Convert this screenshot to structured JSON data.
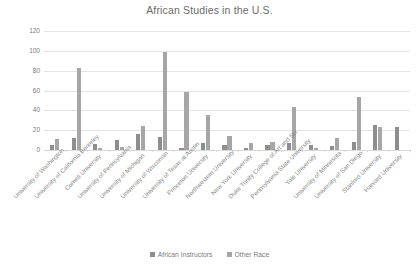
{
  "chart_data": {
    "type": "bar",
    "title": "African Studies in the U.S.",
    "xlabel": "",
    "ylabel": "",
    "ylim": [
      0,
      120
    ],
    "yticks": [
      0,
      20,
      40,
      60,
      80,
      100,
      120
    ],
    "grid": true,
    "legend_position": "bottom",
    "categories": [
      "University of Washington",
      "University of California Berkeley",
      "Cornell University",
      "University of Pennsylvania",
      "University of Michigan",
      "University of Wisconsin",
      "University of Texas at Austin",
      "Princeton University",
      "Northwestern University",
      "New York University",
      "Duke Trinity College of Art and Sci",
      "Pennsylvania State University",
      "Yale University",
      "University of Minnesota",
      "University of San Diego",
      "Stanford University",
      "Harvard University"
    ],
    "series": [
      {
        "name": "African Instructors",
        "color": "#8e8e8e",
        "values": [
          5,
          12,
          6,
          10,
          16,
          13,
          2,
          7,
          5,
          2,
          5,
          7,
          5,
          4,
          8,
          25,
          23
        ]
      },
      {
        "name": "Other Race",
        "color": "#a6a6a6",
        "values": [
          11,
          83,
          2,
          3,
          24,
          99,
          59,
          35,
          14,
          7,
          8,
          43,
          2,
          12,
          53,
          23,
          0
        ]
      }
    ]
  },
  "legend": {
    "entries": [
      {
        "label": "African Instructors",
        "color": "#8e8e8e"
      },
      {
        "label": "Other Race",
        "color": "#a6a6a6"
      }
    ]
  },
  "colors": {
    "series_1": "#8e8e8e",
    "series_2": "#a6a6a6",
    "gridline": "#e4e4e4",
    "text": "#7a7a7a",
    "background": "#ffffff"
  }
}
